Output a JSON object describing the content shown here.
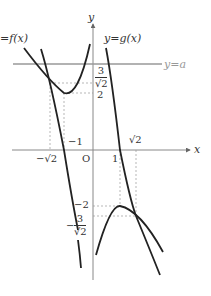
{
  "diagram": {
    "axes": {
      "x_label": "x",
      "y_label": "y",
      "origin_label": "O"
    },
    "curves": {
      "f_label": "y = f(x)",
      "f_label_visible": "=f(x)",
      "g_label": "y=g(x)",
      "horizontal_line_label": "y=a"
    },
    "y_tick_labels": {
      "three_over_root2_top": {
        "num": "3",
        "den": "√2"
      },
      "two_top": "2",
      "minus_two": "−2",
      "minus_three_over_root2": {
        "sign": "−",
        "num": "3",
        "den": "√2"
      }
    },
    "x_tick_labels": {
      "minus_root2": "−√2",
      "minus_one": "−1",
      "one": "1",
      "root2": "√2"
    },
    "colors": {
      "curve": "#222222",
      "axis": "#888888",
      "line_a": "#999999",
      "dashed": "#999999"
    }
  }
}
